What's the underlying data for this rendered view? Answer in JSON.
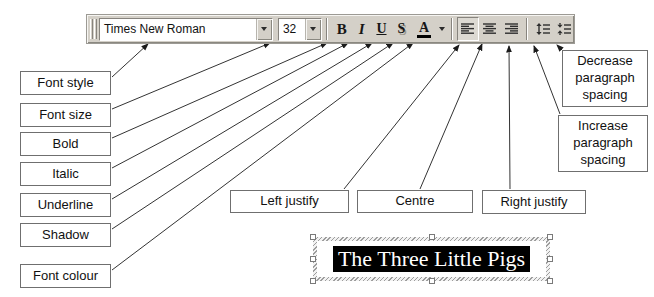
{
  "toolbar": {
    "font_combo": {
      "value": "Times New Roman"
    },
    "size_combo": {
      "value": "32"
    },
    "bold_glyph": "B",
    "italic_glyph": "I",
    "underline_glyph": "U",
    "shadow_glyph": "S",
    "font_color_glyph": "A",
    "colors": {
      "face": "#d4d0c8",
      "highlight": "#f6f5f2",
      "shadow_edge": "#87847e",
      "glyph": "#161616",
      "font_color_bar": "#000000"
    }
  },
  "callouts": {
    "font_style": "Font style",
    "font_size": "Font size",
    "bold": "Bold",
    "italic": "Italic",
    "underline": "Underline",
    "shadow": "Shadow",
    "font_colour": "Font colour",
    "left_justify": "Left justify",
    "centre": "Centre",
    "right_justify": "Right justify",
    "decrease_spacing": "Decrease paragraph spacing",
    "increase_spacing": "Increase paragraph spacing"
  },
  "textbox": {
    "text": "The Three Little Pigs"
  }
}
